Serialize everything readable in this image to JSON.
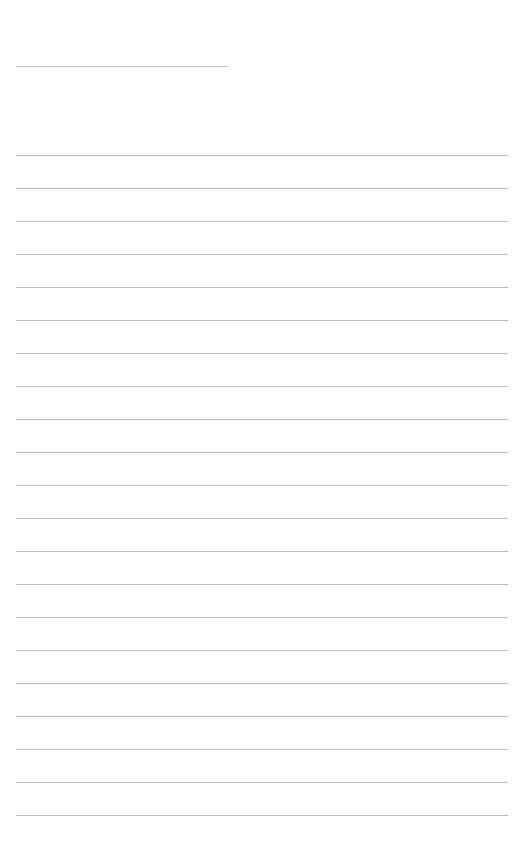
{
  "page": {
    "type": "lined-paper",
    "background_color": "#fefefe",
    "line_color": "#bcbcbc",
    "header_line": {
      "x": 16,
      "y": 66,
      "width": 212
    },
    "rules": {
      "count": 21,
      "x": 16,
      "width": 492,
      "first_y": 155,
      "spacing": 33
    },
    "text": []
  }
}
